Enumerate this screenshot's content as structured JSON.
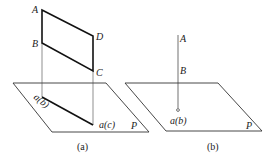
{
  "figure_a": {
    "caption": "(a)",
    "points": {
      "A": "A",
      "B": "B",
      "C": "C",
      "D": "D"
    },
    "projection_ab": "a(b)",
    "projection_dc": "a(c)",
    "plane": "P"
  },
  "figure_b": {
    "caption": "(b)",
    "points": {
      "A": "A",
      "B": "B"
    },
    "projection_ab": "a(b)",
    "plane": "P"
  },
  "colors": {
    "line": "#222222",
    "background": "#ffffff"
  }
}
